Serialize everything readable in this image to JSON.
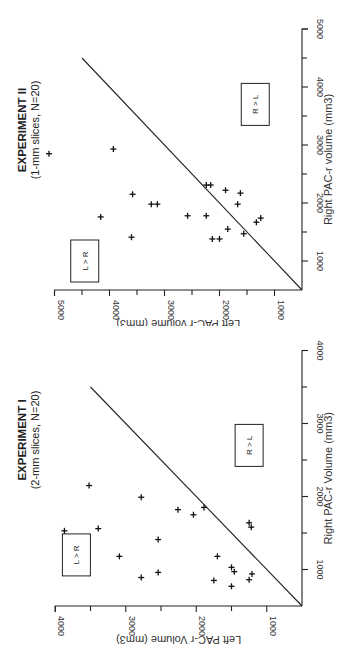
{
  "chart_data": [
    {
      "type": "scatter",
      "id": "experiment-1",
      "title": "EXPERIMENT I",
      "subtitle": "(2-mm slices, N=20)",
      "xlabel": "Right PAC-r Volume (mm3)",
      "ylabel": "Left PAC-r Volume (mm3)",
      "xlim": [
        500,
        4000
      ],
      "ylim": [
        500,
        4000
      ],
      "xticks": [
        1000,
        2000,
        3000,
        4000
      ],
      "yticks": [
        1000,
        2000,
        3000,
        4000
      ],
      "minor_tick_step": 500,
      "grid": false,
      "orientation": "rotated 90 degrees clockwise",
      "reference_line": {
        "label": "identity line",
        "from": [
          500,
          500
        ],
        "to": [
          3500,
          3500
        ]
      },
      "region_labels": [
        {
          "text": "L > R",
          "x": 1200,
          "y": 3700
        },
        {
          "text": "R > L",
          "x": 2700,
          "y": 1250
        }
      ],
      "points": [
        {
          "x": 2150,
          "y": 3520
        },
        {
          "x": 1990,
          "y": 2780
        },
        {
          "x": 1530,
          "y": 3870
        },
        {
          "x": 1560,
          "y": 3390
        },
        {
          "x": 1410,
          "y": 2540
        },
        {
          "x": 1180,
          "y": 3090
        },
        {
          "x": 890,
          "y": 2780
        },
        {
          "x": 960,
          "y": 2540
        },
        {
          "x": 1820,
          "y": 2260
        },
        {
          "x": 1750,
          "y": 2040
        },
        {
          "x": 1850,
          "y": 1890
        },
        {
          "x": 1640,
          "y": 1250
        },
        {
          "x": 1580,
          "y": 1220
        },
        {
          "x": 1180,
          "y": 1700
        },
        {
          "x": 1030,
          "y": 1500
        },
        {
          "x": 970,
          "y": 1460
        },
        {
          "x": 940,
          "y": 1210
        },
        {
          "x": 850,
          "y": 1750
        },
        {
          "x": 860,
          "y": 1250
        },
        {
          "x": 770,
          "y": 1500
        }
      ]
    },
    {
      "type": "scatter",
      "id": "experiment-2",
      "title": "EXPERIMENT II",
      "subtitle": "(1-mm slices, N=20)",
      "xlabel": "Right PAC-r volume (mm3)",
      "ylabel": "Left PAC-r volume (mm3)",
      "xlim": [
        500,
        5000
      ],
      "ylim": [
        500,
        5000
      ],
      "xticks": [
        1000,
        2000,
        3000,
        4000,
        5000
      ],
      "yticks": [
        1000,
        2000,
        3000,
        4000,
        5000
      ],
      "minor_tick_step": 500,
      "grid": false,
      "orientation": "rotated 90 degrees clockwise",
      "reference_line": {
        "label": "identity line",
        "from": [
          500,
          500
        ],
        "to": [
          4500,
          4500
        ]
      },
      "region_labels": [
        {
          "text": "L > R",
          "x": 1000,
          "y": 4450
        },
        {
          "text": "R > L",
          "x": 3700,
          "y": 1350
        }
      ],
      "points": [
        {
          "x": 2850,
          "y": 5100
        },
        {
          "x": 2930,
          "y": 3930
        },
        {
          "x": 2150,
          "y": 3580
        },
        {
          "x": 1980,
          "y": 3240
        },
        {
          "x": 1980,
          "y": 3130
        },
        {
          "x": 1760,
          "y": 4160
        },
        {
          "x": 1410,
          "y": 3600
        },
        {
          "x": 2310,
          "y": 2240
        },
        {
          "x": 2310,
          "y": 2160
        },
        {
          "x": 2220,
          "y": 1890
        },
        {
          "x": 2170,
          "y": 1620
        },
        {
          "x": 1980,
          "y": 1670
        },
        {
          "x": 1780,
          "y": 2580
        },
        {
          "x": 1780,
          "y": 2240
        },
        {
          "x": 1550,
          "y": 1850
        },
        {
          "x": 1670,
          "y": 1330
        },
        {
          "x": 1740,
          "y": 1250
        },
        {
          "x": 1380,
          "y": 2130
        },
        {
          "x": 1380,
          "y": 2000
        },
        {
          "x": 1470,
          "y": 1560
        }
      ]
    }
  ]
}
